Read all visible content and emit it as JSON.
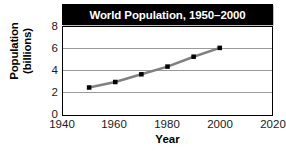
{
  "chart_data": {
    "type": "line",
    "title": "World Population, 1950–2000",
    "xlabel": "Year",
    "ylabel_line1": "Population",
    "ylabel_line2": "(billions)",
    "x": [
      1950,
      1960,
      1970,
      1980,
      1990,
      2000
    ],
    "values": [
      2.5,
      3.0,
      3.7,
      4.4,
      5.3,
      6.1
    ],
    "series": [
      {
        "name": "World population",
        "x": [
          1950,
          1960,
          1970,
          1980,
          1990,
          2000
        ],
        "values": [
          2.5,
          3.0,
          3.7,
          4.4,
          5.3,
          6.1
        ]
      }
    ],
    "xlim": [
      1940,
      2020
    ],
    "ylim": [
      0,
      8
    ],
    "xticks": [
      1940,
      1960,
      1980,
      2000,
      2020
    ],
    "yticks": [
      0,
      2,
      4,
      6,
      8
    ],
    "xtick_labels": [
      "1940",
      "1960",
      "1980",
      "2000",
      "2020"
    ],
    "ytick_labels": [
      "0",
      "2",
      "4",
      "6",
      "8"
    ],
    "gridlines": "horizontal",
    "legend": "none",
    "line_color": "#808080",
    "marker_color": "#000000",
    "marker_shape": "square",
    "title_background": "#000000",
    "title_text_color": "#ffffff",
    "grid_color": "#9a9a9a",
    "axis_color": "#000000"
  }
}
